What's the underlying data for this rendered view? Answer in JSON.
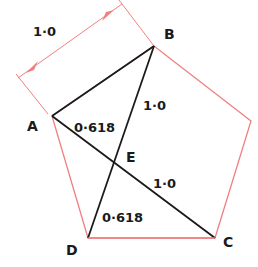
{
  "diagram": {
    "type": "geometry",
    "colors": {
      "pentagon": "#f08080",
      "diagonals": "#1a1a1a",
      "dimension": "#f08080",
      "labels": "#1a1a1a"
    },
    "vertices": {
      "A": {
        "label": "A",
        "x": 52,
        "y": 116
      },
      "B": {
        "label": "B",
        "x": 154,
        "y": 46
      },
      "R": {
        "label": "",
        "x": 251,
        "y": 121
      },
      "C": {
        "label": "C",
        "x": 215,
        "y": 238
      },
      "D": {
        "label": "D",
        "x": 88,
        "y": 238
      },
      "E": {
        "label": "E",
        "x": 114,
        "y": 165
      }
    },
    "dimension": {
      "label": "1·0",
      "from": {
        "x": 18,
        "y": 78
      },
      "to": {
        "x": 122,
        "y": 4
      }
    },
    "segment_labels": {
      "AE": "0·618",
      "BE": "1·0",
      "EC": "1·0",
      "DE": "0·618"
    },
    "vertex_labels": {
      "A": "A",
      "B": "B",
      "C": "C",
      "D": "D",
      "E": "E"
    }
  }
}
